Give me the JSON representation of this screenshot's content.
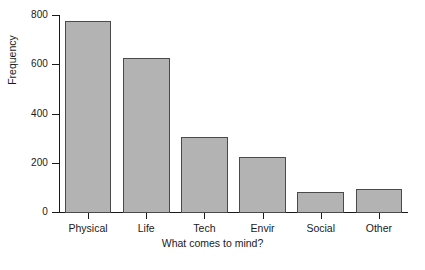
{
  "chart_data": {
    "type": "bar",
    "title": "",
    "subtitle": "",
    "categories": [
      "Physical",
      "Life",
      "Tech",
      "Envir",
      "Social",
      "Other"
    ],
    "values": [
      775,
      625,
      305,
      225,
      80,
      95
    ],
    "series": [
      {
        "name": "Frequency",
        "values": [
          775,
          625,
          305,
          225,
          80,
          95
        ]
      }
    ],
    "xlabel": "What comes to mind?",
    "ylabel": "Frequency",
    "ylim": [
      0,
      800
    ],
    "yticks": [
      0,
      200,
      400,
      600,
      800
    ],
    "ytick_labels": [
      "0",
      "200",
      "400",
      "600",
      "800"
    ],
    "grid": false,
    "legend": false,
    "legend_position": "none",
    "bar_fill_color": "#b3b3b3",
    "bar_edge_color": "#4a4a4a",
    "axis_color": "#1a1a1a",
    "background_color": "#ffffff"
  },
  "caption": {
    "partial_text": ""
  }
}
